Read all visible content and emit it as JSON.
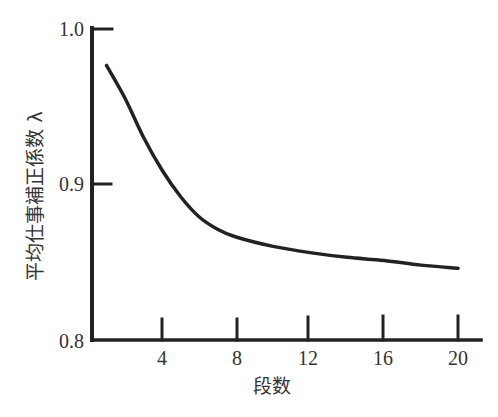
{
  "chart_data": {
    "type": "line",
    "title": "",
    "xlabel": "段数",
    "ylabel": "平均仕事補正係数 λ",
    "xlim": [
      0,
      21
    ],
    "ylim": [
      0.8,
      1.0
    ],
    "x_ticks": [
      4,
      8,
      12,
      16,
      20
    ],
    "x_tick_labels": [
      "4",
      "8",
      "12",
      "16",
      "20"
    ],
    "y_ticks": [
      0.8,
      0.9,
      1.0
    ],
    "y_tick_labels": [
      "0.8",
      "0.9",
      "1.0"
    ],
    "grid": false,
    "legend": null,
    "series": [
      {
        "name": "λ",
        "x": [
          1,
          2,
          3,
          4,
          5,
          6,
          7,
          8,
          10,
          12,
          14,
          16,
          18,
          20
        ],
        "values": [
          0.976,
          0.955,
          0.93,
          0.909,
          0.892,
          0.879,
          0.871,
          0.866,
          0.86,
          0.856,
          0.853,
          0.851,
          0.848,
          0.846
        ]
      }
    ]
  },
  "labels": {
    "xlabel": "段数",
    "ylabel": "平均仕事補正係数 λ",
    "y_ticks": [
      "1.0",
      "0.9",
      "0.8"
    ],
    "x_ticks": [
      "4",
      "8",
      "12",
      "16",
      "20"
    ]
  }
}
